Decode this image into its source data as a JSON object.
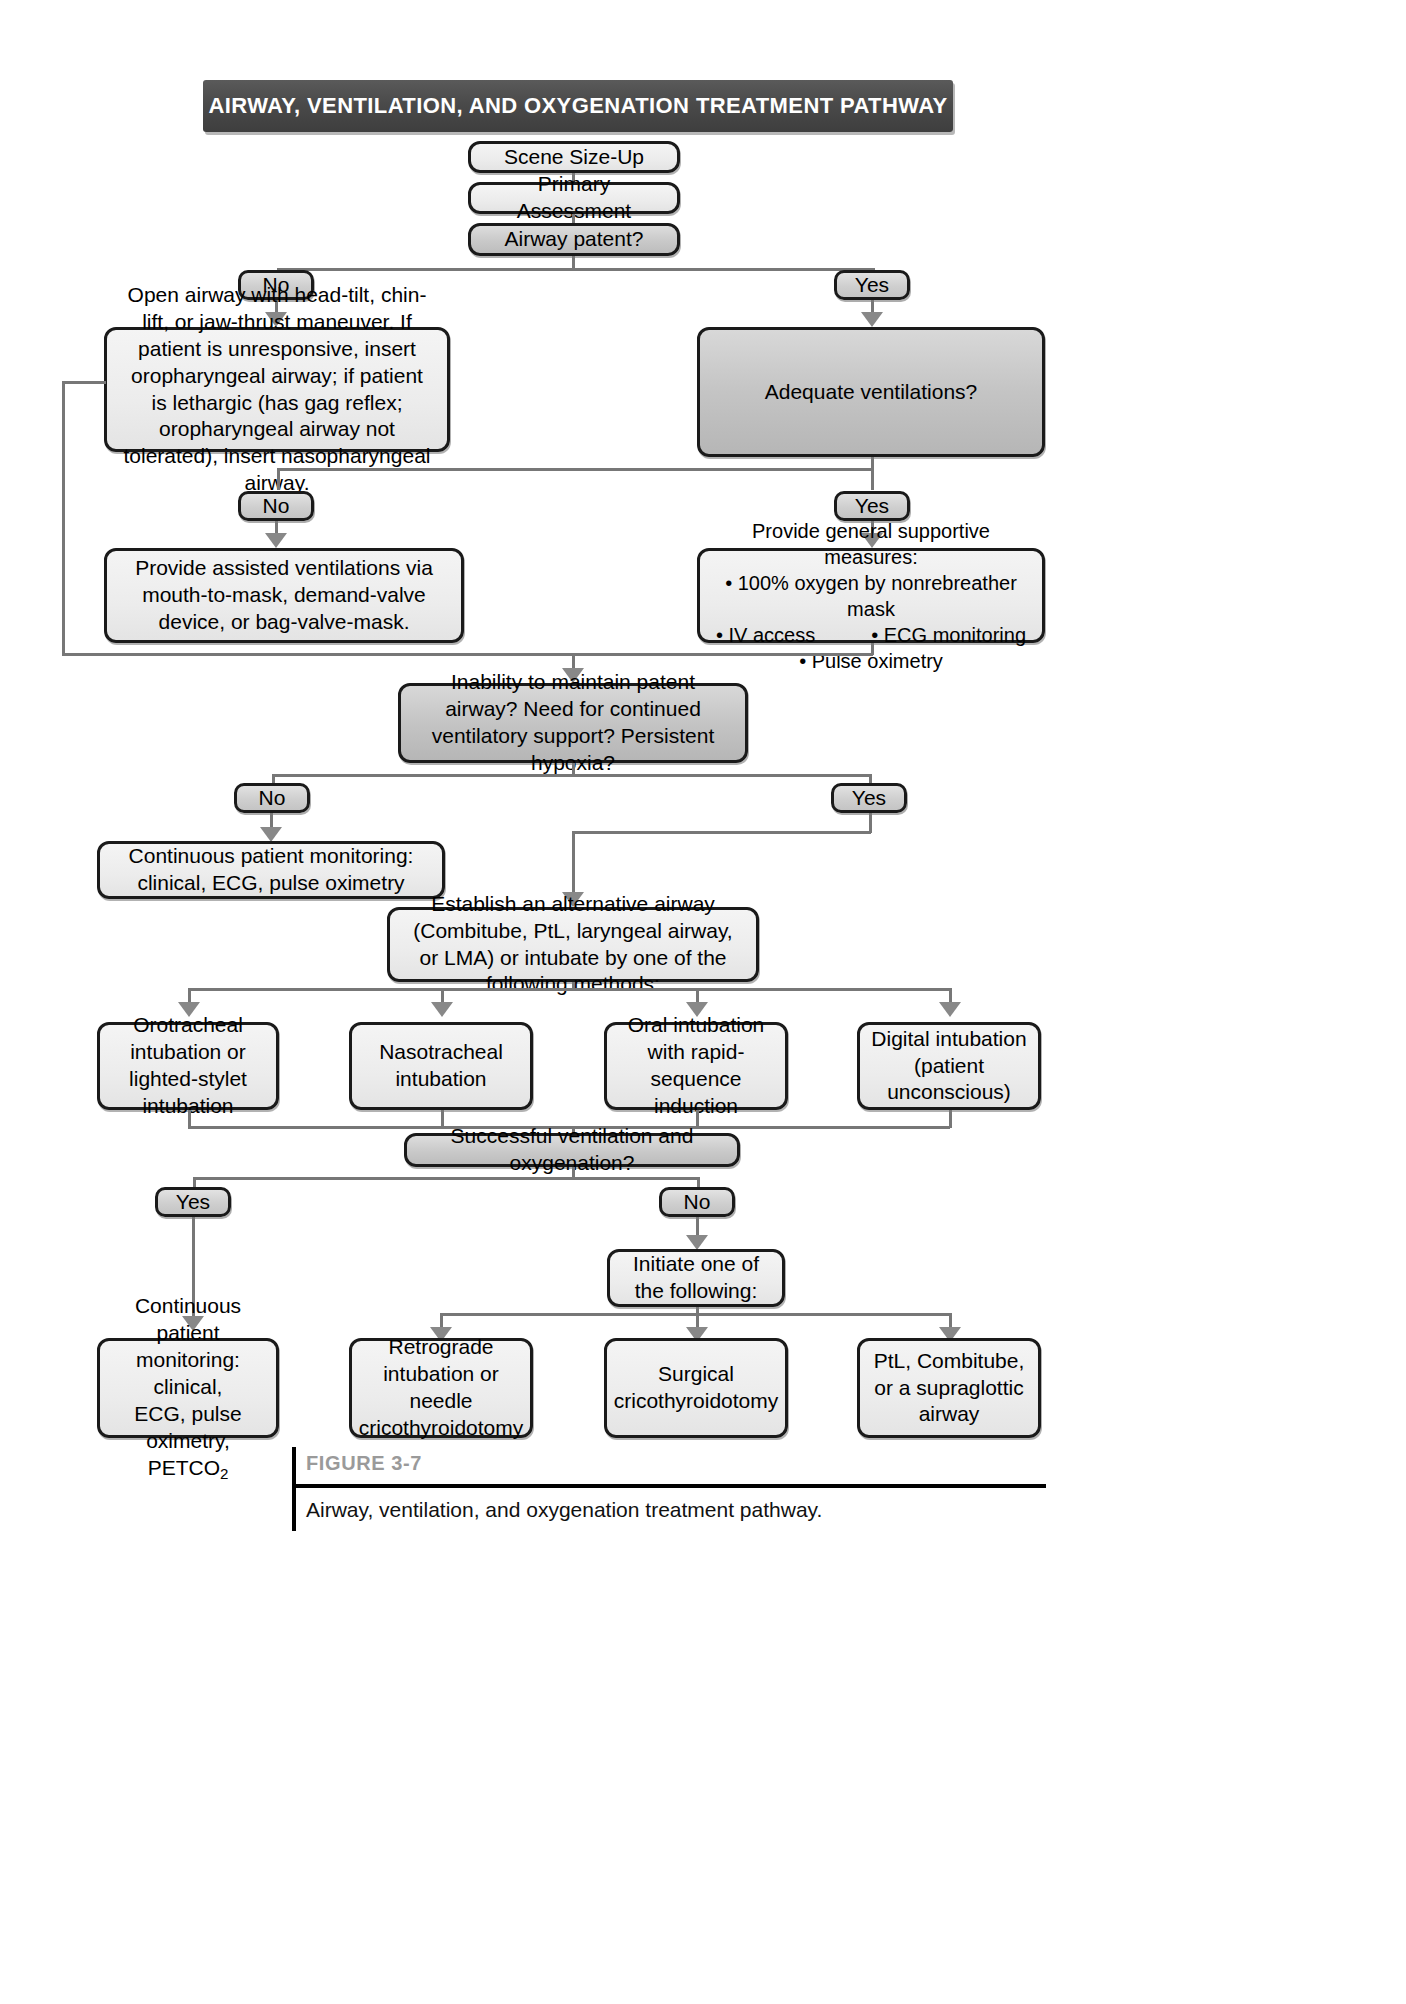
{
  "header": {
    "title": "AIRWAY, VENTILATION, AND OXYGENATION TREATMENT PATHWAY"
  },
  "nodes": {
    "scene_size_up": "Scene Size-Up",
    "primary_assessment": "Primary Assessment",
    "airway_patent": "Airway patent?",
    "open_airway": "Open airway with head-tilt, chin-lift, or jaw-thrust maneuver. If patient is unresponsive, insert oropharyngeal airway; if patient is lethargic (has gag reflex; oropharyngeal airway not tolerated), insert nasopharyngeal airway.",
    "adequate_ventilations": "Adequate ventilations?",
    "assisted_ventilations": "Provide assisted ventilations via mouth-to-mask, demand-valve device, or bag-valve-mask.",
    "supportive_title": "Provide general supportive measures:",
    "supportive_b1": "• 100% oxygen by nonrebreather mask",
    "supportive_b2": "• IV access",
    "supportive_b3": "• ECG monitoring",
    "supportive_b4": "• Pulse oximetry",
    "inability_decision": "Inability to maintain patent airway? Need for continued ventilatory support? Persistent hypoxia?",
    "continuous_monitoring_1": "Continuous patient monitoring: clinical, ECG, pulse oximetry",
    "establish_alt_airway": "Establish an alternative airway (Combitube, PtL, laryngeal airway, or LMA) or intubate by one of the following methods:",
    "orotracheal": "Orotracheal intubation or lighted-stylet intubation",
    "nasotracheal": "Nasotracheal intubation",
    "oral_rsi": "Oral intubation with rapid-sequence induction",
    "digital": "Digital intubation (patient unconscious)",
    "successful_vent": "Successful ventilation and oxygenation?",
    "initiate_one": "Initiate one of the following:",
    "continuous_monitoring_2_l1": "Continuous patient",
    "continuous_monitoring_2_l2": "monitoring: clinical,",
    "continuous_monitoring_2_l3": "ECG, pulse oximetry,",
    "continuous_monitoring_2_l4": "PETCO",
    "continuous_monitoring_2_sub": "2",
    "retrograde": "Retrograde intubation or needle cricothyroidotomy",
    "surgical_cric": "Surgical cricothyroidotomy",
    "ptl_combitube": "PtL, Combitube, or a supraglottic airway"
  },
  "branch_labels": {
    "no_airway": "No",
    "yes_airway": "Yes",
    "no_vent": "No",
    "yes_vent": "Yes",
    "no_inability": "No",
    "yes_inability": "Yes",
    "yes_success": "Yes",
    "no_success": "No"
  },
  "caption": {
    "figure_label": "FIGURE 3-7",
    "text": "Airway, ventilation, and oxygenation treatment pathway."
  },
  "colors": {
    "banner_bg": "#4a4a4a",
    "banner_text": "#ffffff",
    "node_fill": "#ececec",
    "decision_fill": "#c6c6c6",
    "border": "#1a1a1a",
    "connector": "#777777",
    "figure_label": "#9a9a9a"
  }
}
